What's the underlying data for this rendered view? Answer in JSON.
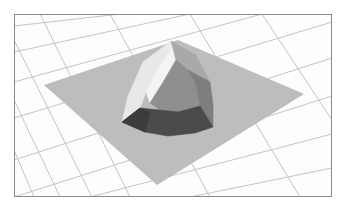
{
  "scene": {
    "background": "#ffffff",
    "frame": {
      "x": 14,
      "y": 14,
      "w": 318,
      "h": 183,
      "stroke": "#8a8a8a",
      "bg": "#fdfdfd"
    },
    "grid": {
      "stroke": "#c4c4c4",
      "family_a": [
        [
          [
            14,
            26
          ],
          [
            120,
            14
          ]
        ],
        [
          [
            14,
            52
          ],
          [
            190,
            14
          ]
        ],
        [
          [
            14,
            82
          ],
          [
            262,
            14
          ]
        ],
        [
          [
            14,
            118
          ],
          [
            332,
            22
          ]
        ],
        [
          [
            14,
            160
          ],
          [
            332,
            58
          ]
        ],
        [
          [
            14,
            197
          ],
          [
            332,
            96
          ]
        ],
        [
          [
            90,
            197
          ],
          [
            332,
            134
          ]
        ],
        [
          [
            190,
            197
          ],
          [
            332,
            168
          ]
        ]
      ],
      "family_b": [
        [
          [
            40,
            14
          ],
          [
            130,
            197
          ]
        ],
        [
          [
            14,
            40
          ],
          [
            92,
            197
          ]
        ],
        [
          [
            14,
            100
          ],
          [
            60,
            197
          ]
        ],
        [
          [
            110,
            14
          ],
          [
            210,
            197
          ]
        ],
        [
          [
            190,
            14
          ],
          [
            300,
            197
          ]
        ],
        [
          [
            262,
            14
          ],
          [
            332,
            120
          ]
        ],
        [
          [
            14,
            150
          ],
          [
            34,
            197
          ]
        ]
      ]
    },
    "plane": {
      "fill": "#bdbdbd",
      "points": [
        [
          44,
          85
        ],
        [
          178,
          40
        ],
        [
          304,
          94
        ],
        [
          157,
          185
        ]
      ]
    },
    "dome": {
      "facets": [
        {
          "name": "left-light-facet",
          "fill": "#e8e8e8",
          "points": [
            [
              122,
              122
            ],
            [
              128,
              96
            ],
            [
              143,
              62
            ],
            [
              171,
              41
            ],
            [
              170,
              52
            ],
            [
              158,
              68
            ],
            [
              146,
              92
            ],
            [
              140,
              108
            ]
          ]
        },
        {
          "name": "left-highlight-facet",
          "fill": "#f4f4f4",
          "points": [
            [
              146,
              92
            ],
            [
              158,
              68
            ],
            [
              170,
              52
            ],
            [
              171,
              41
            ],
            [
              176,
              60
            ],
            [
              162,
              84
            ],
            [
              150,
              103
            ]
          ]
        },
        {
          "name": "top-right-facet",
          "fill": "#a9a9a9",
          "points": [
            [
              171,
              41
            ],
            [
              196,
              55
            ],
            [
              210,
              82
            ],
            [
              188,
              70
            ],
            [
              176,
              60
            ]
          ]
        },
        {
          "name": "center-facet",
          "fill": "#8f8f8f",
          "points": [
            [
              150,
              103
            ],
            [
              162,
              84
            ],
            [
              176,
              60
            ],
            [
              188,
              70
            ],
            [
              196,
              84
            ],
            [
              200,
              106
            ],
            [
              178,
              112
            ],
            [
              160,
              110
            ]
          ]
        },
        {
          "name": "right-facet",
          "fill": "#7e7e7e",
          "points": [
            [
              188,
              70
            ],
            [
              210,
              82
            ],
            [
              213,
              105
            ],
            [
              213,
              127
            ],
            [
              200,
              106
            ],
            [
              196,
              84
            ]
          ]
        },
        {
          "name": "front-dark-band",
          "fill": "#4a4a4a",
          "points": [
            [
              122,
              122
            ],
            [
              140,
              108
            ],
            [
              160,
              110
            ],
            [
              178,
              112
            ],
            [
              200,
              106
            ],
            [
              213,
              127
            ],
            [
              195,
              133
            ],
            [
              168,
              136
            ],
            [
              145,
              132
            ]
          ]
        },
        {
          "name": "front-left-dark-facet",
          "fill": "#3c3c3c",
          "points": [
            [
              122,
              122
            ],
            [
              140,
              108
            ],
            [
              150,
              112
            ],
            [
              145,
              132
            ]
          ]
        }
      ]
    }
  }
}
